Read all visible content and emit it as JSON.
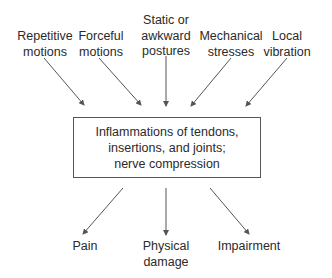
{
  "causes": [
    {
      "lines": [
        "Repetitive",
        "motions"
      ],
      "x": 45,
      "y": 29
    },
    {
      "lines": [
        "Forceful",
        "motions"
      ],
      "x": 101,
      "y": 29
    },
    {
      "lines": [
        "Static or",
        "awkward",
        "postures"
      ],
      "x": 166,
      "y": 13
    },
    {
      "lines": [
        "Mechanical",
        "stresses"
      ],
      "x": 231,
      "y": 29
    },
    {
      "lines": [
        "Local",
        "vibration"
      ],
      "x": 287,
      "y": 29
    }
  ],
  "center_box": {
    "lines": [
      "Inflammations of tendons,",
      "insertions, and joints;",
      "nerve compression"
    ]
  },
  "effects": [
    {
      "lines": [
        "Pain"
      ],
      "x": 85,
      "y": 239
    },
    {
      "lines": [
        "Physical",
        "damage"
      ],
      "x": 166,
      "y": 239
    },
    {
      "lines": [
        "Impairment"
      ],
      "x": 249,
      "y": 239
    }
  ],
  "arrow_color": "#555555"
}
